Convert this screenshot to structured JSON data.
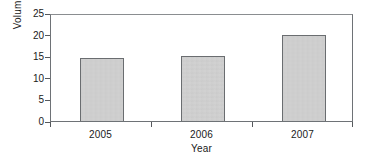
{
  "chart_data": {
    "type": "bar",
    "title": "",
    "subtitle": "",
    "xlabel": "Year",
    "ylabel": "Volume",
    "categories": [
      "2005",
      "2006",
      "2007"
    ],
    "values": [
      14.6,
      15.0,
      20.0
    ],
    "series": [
      {
        "name": "Volume",
        "values": [
          14.6,
          15.0,
          20.0
        ]
      }
    ],
    "ylim": [
      0,
      25
    ],
    "ytick_labels": [
      "0",
      "5",
      "10",
      "15",
      "20",
      "25"
    ],
    "ytick_values": [
      0,
      5,
      10,
      15,
      20,
      25
    ],
    "grid": false,
    "legend": "none",
    "bar_fill_color": "#d3d3d3",
    "bar_edge_color": "#6a6d70",
    "axis_color": "#6e7276",
    "text_color": "#1a1a1a",
    "background_color": "#ffffff"
  }
}
